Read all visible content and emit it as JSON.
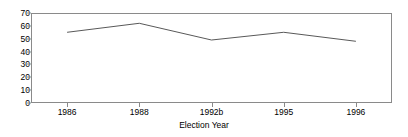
{
  "chart_data": {
    "type": "line",
    "title": "",
    "xlabel": "Election Year",
    "ylabel": "",
    "categories": [
      "1986",
      "1988",
      "1992b",
      "1995",
      "1996"
    ],
    "values": [
      55,
      62,
      49,
      55,
      48
    ],
    "series": [
      {
        "name": "",
        "values": [
          55,
          62,
          49,
          55,
          48
        ]
      }
    ],
    "ylim": [
      0,
      70
    ],
    "yticks": [
      0,
      10,
      20,
      30,
      40,
      50,
      60,
      70
    ],
    "ytick_labels": [
      "0",
      "10",
      "20",
      "30",
      "40",
      "50",
      "60",
      "70"
    ],
    "xtick_labels": [
      "1986",
      "1988",
      "1992b",
      "1995",
      "1996"
    ],
    "grid": false,
    "legend": false,
    "legend_position": "none",
    "markers": false,
    "line_color": "#595959",
    "axis_color": "#8a8a8a",
    "background_color": "#ffffff"
  },
  "axis": {
    "x_title": "Election Year"
  }
}
